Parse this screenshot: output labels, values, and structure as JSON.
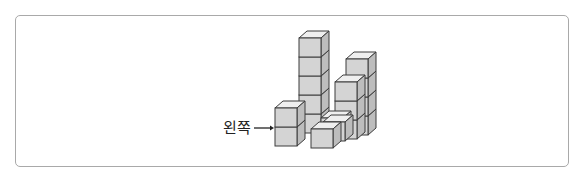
{
  "figure": {
    "label": "왼쪽",
    "arrow": "→",
    "colors": {
      "front_face": "#d4d4d4",
      "side_face": "#bdbdbd",
      "top_face": "#efefef",
      "edge": "#3c3c3c",
      "frame_border": "#a9a9a9"
    },
    "stacks": [
      {
        "name": "left-front-stack",
        "height": 2
      },
      {
        "name": "tall-center-stack",
        "height": 5
      },
      {
        "name": "front-low-row",
        "height": 1,
        "length": 2
      },
      {
        "name": "right-middle-stack",
        "height": 3
      },
      {
        "name": "right-back-stack",
        "height": 4
      }
    ]
  }
}
